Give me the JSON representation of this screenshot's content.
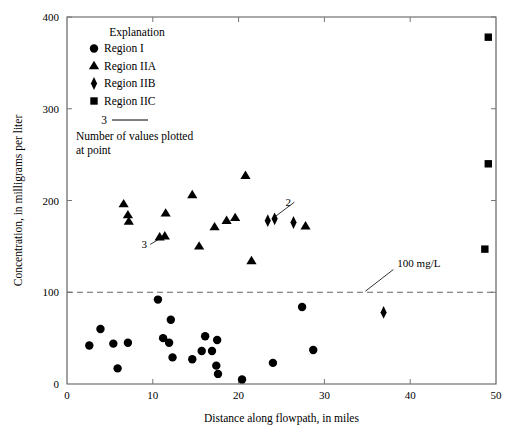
{
  "chart_data": {
    "type": "scatter",
    "title": "",
    "xlabel": "Distance along flowpath, in miles",
    "ylabel": "Concentration, in milligrams per liter",
    "xlim": [
      0,
      50
    ],
    "ylim": [
      0,
      400
    ],
    "xticks": [
      0,
      10,
      20,
      30,
      40,
      50
    ],
    "yticks": [
      0,
      100,
      200,
      300,
      400
    ],
    "xticklabels": [
      "0",
      "10",
      "20",
      "30",
      "40",
      "50"
    ],
    "yticklabels": [
      "0",
      "100",
      "200",
      "300",
      "400"
    ],
    "grid": false,
    "legend_position": "upper-left-inside",
    "series": [
      {
        "name": "Region I",
        "marker": "circle",
        "color": "#000000",
        "points": [
          [
            2.6,
            42
          ],
          [
            3.9,
            60
          ],
          [
            5.4,
            44
          ],
          [
            5.9,
            17
          ],
          [
            7.1,
            45
          ],
          [
            10.6,
            92
          ],
          [
            11.2,
            50
          ],
          [
            11.9,
            45
          ],
          [
            12.1,
            70
          ],
          [
            12.3,
            29
          ],
          [
            14.6,
            27
          ],
          [
            15.7,
            36
          ],
          [
            16.1,
            52
          ],
          [
            16.9,
            36
          ],
          [
            17.4,
            20
          ],
          [
            17.5,
            48
          ],
          [
            17.6,
            11
          ],
          [
            20.4,
            5
          ],
          [
            24.0,
            23
          ],
          [
            27.4,
            84
          ],
          [
            28.7,
            37
          ]
        ]
      },
      {
        "name": "Region IIA",
        "marker": "triangle",
        "color": "#000000",
        "points": [
          [
            6.6,
            196
          ],
          [
            7.1,
            184
          ],
          [
            7.2,
            177
          ],
          [
            10.8,
            160
          ],
          [
            11.4,
            161
          ],
          [
            11.5,
            186
          ],
          [
            14.6,
            206
          ],
          [
            15.4,
            150
          ],
          [
            17.2,
            171
          ],
          [
            18.6,
            178
          ],
          [
            19.6,
            181
          ],
          [
            20.8,
            227
          ],
          [
            21.5,
            134
          ],
          [
            27.8,
            172
          ]
        ]
      },
      {
        "name": "Region IIB",
        "marker": "diamond",
        "color": "#000000",
        "points": [
          [
            23.4,
            178
          ],
          [
            24.2,
            180
          ],
          [
            26.4,
            176
          ],
          [
            36.9,
            78
          ]
        ]
      },
      {
        "name": "Region IIC",
        "marker": "square",
        "color": "#000000",
        "points": [
          [
            49.1,
            378
          ],
          [
            49.1,
            240
          ],
          [
            48.7,
            147
          ]
        ]
      }
    ],
    "reference_lines": [
      {
        "name": "100 mg/L",
        "orientation": "horizontal",
        "value": 100,
        "style": "dashed",
        "label": "100 mg/L",
        "label_x": 38.5,
        "label_y": 128
      }
    ],
    "annotations": [
      {
        "text": "3",
        "label_x": 9.0,
        "label_y": 150,
        "target_x": 11.3,
        "target_y": 161,
        "note": "Number of values plotted at point"
      },
      {
        "text": "2",
        "label_x": 25.8,
        "label_y": 196,
        "target_x": 24.2,
        "target_y": 182,
        "note": "Number of values plotted at point"
      }
    ]
  },
  "legend": {
    "title": "Explanation",
    "items": [
      {
        "marker": "circle",
        "label": "Region I"
      },
      {
        "marker": "triangle",
        "label": "Region IIA"
      },
      {
        "marker": "diamond",
        "label": "Region IIB"
      },
      {
        "marker": "square",
        "label": "Region IIC"
      }
    ],
    "count_example": "3",
    "note_line1": "Number of values plotted",
    "note_line2": "at point"
  }
}
